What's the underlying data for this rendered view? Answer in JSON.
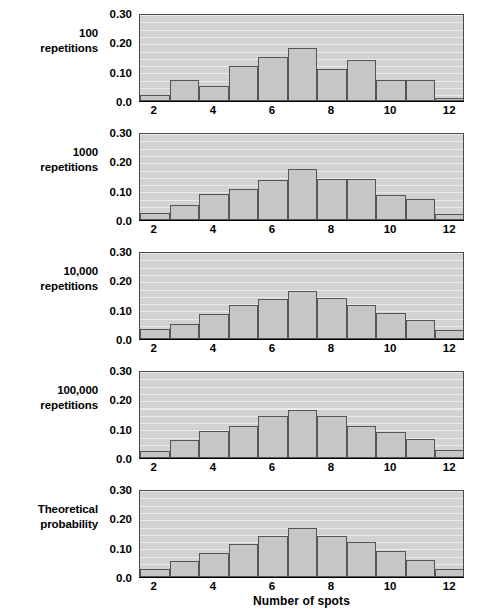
{
  "figure": {
    "xaxis_title": "Number of spots",
    "y_ticks": [
      "0.30",
      "0.20",
      "0.10",
      "0.0"
    ],
    "y_tick_values": [
      0.3,
      0.2,
      0.1,
      0.0
    ],
    "x_ticks": [
      "2",
      "4",
      "6",
      "8",
      "10",
      "12"
    ],
    "x_tick_values": [
      2,
      4,
      6,
      8,
      10,
      12
    ],
    "colors": {
      "plot_background": "#d2d2d2",
      "bar_fill": "#c6c6c6",
      "bar_border": "#555555",
      "axis": "#000000",
      "gridline": "#ffffff",
      "text": "#000000"
    }
  },
  "chart_data": {
    "type": "bar",
    "title": "",
    "xlabel": "Number of spots",
    "ylabel": "",
    "ylim": [
      0.0,
      0.3
    ],
    "xlim": [
      1.5,
      12.5
    ],
    "grid": true,
    "legend": "none",
    "categories": [
      2,
      3,
      4,
      5,
      6,
      7,
      8,
      9,
      10,
      11,
      12
    ],
    "panels": [
      {
        "label_lines": [
          "100",
          "repetitions"
        ],
        "label_text": "100 repetitions",
        "values": [
          0.02,
          0.07,
          0.05,
          0.12,
          0.15,
          0.18,
          0.11,
          0.14,
          0.07,
          0.07,
          0.01
        ]
      },
      {
        "label_lines": [
          "1000",
          "repetitions"
        ],
        "label_text": "1000 repetitions",
        "values": [
          0.025,
          0.05,
          0.09,
          0.105,
          0.135,
          0.175,
          0.14,
          0.14,
          0.085,
          0.07,
          0.02
        ]
      },
      {
        "label_lines": [
          "10,000",
          "repetitions"
        ],
        "label_text": "10,000 repetitions",
        "values": [
          0.035,
          0.05,
          0.085,
          0.115,
          0.135,
          0.162,
          0.14,
          0.115,
          0.09,
          0.065,
          0.03
        ]
      },
      {
        "label_lines": [
          "100,000",
          "repetitions"
        ],
        "label_text": "100,000 repetitions",
        "values": [
          0.025,
          0.062,
          0.093,
          0.11,
          0.142,
          0.165,
          0.142,
          0.11,
          0.088,
          0.066,
          0.028
        ]
      },
      {
        "label_lines": [
          "Theoretical",
          "probability"
        ],
        "label_text": "Theoretical probability",
        "values": [
          0.028,
          0.056,
          0.083,
          0.111,
          0.139,
          0.167,
          0.139,
          0.118,
          0.089,
          0.058,
          0.028
        ]
      }
    ]
  }
}
